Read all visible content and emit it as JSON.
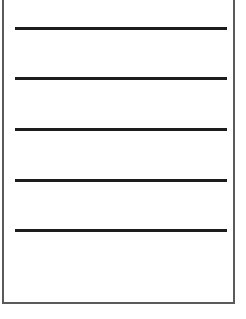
{
  "sheet": {
    "border_color": "#5a5a5a",
    "rule_color": "#1c1c1c",
    "rules": [
      {
        "y": 27
      },
      {
        "y": 77
      },
      {
        "y": 128
      },
      {
        "y": 179
      },
      {
        "y": 229
      }
    ]
  }
}
